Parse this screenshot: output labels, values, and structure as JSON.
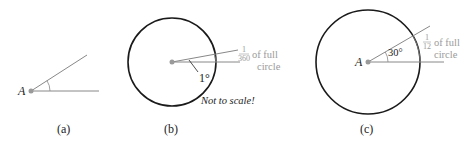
{
  "figure": {
    "panels": [
      {
        "id": "a",
        "caption": "(a)",
        "vertex_label": "A"
      },
      {
        "id": "b",
        "caption": "(b)",
        "angle_label": "1°",
        "fraction_num": "1",
        "fraction_den": "360",
        "fraction_text_1": "of full",
        "fraction_text_2": "circle",
        "note": "Not to scale!"
      },
      {
        "id": "c",
        "caption": "(c)",
        "vertex_label": "A",
        "angle_label": "30°",
        "fraction_num": "1",
        "fraction_den": "12",
        "fraction_text_1": "of full",
        "fraction_text_2": "circle"
      }
    ],
    "colors": {
      "circle": "#1a1a1a",
      "ray": "#888888",
      "vertex": "#9a9a9a",
      "gray_text": "#9a9a9a"
    }
  }
}
